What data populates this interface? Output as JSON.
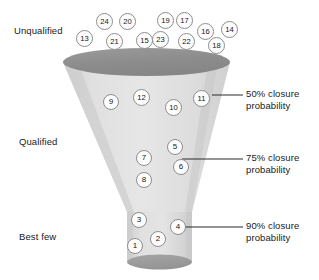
{
  "diagram": {
    "colors": {
      "funnel_body_light": "#e2e2e2",
      "funnel_body_mid": "#d2d2d2",
      "funnel_top_ellipse": "#8f8f8f",
      "funnel_bottom_ellipse": "#9a9a9a",
      "node_fill": "#fdfdfd",
      "node_stroke": "#8d8d8d",
      "text": "#1a1a1a",
      "leader_line": "#2b2b2b"
    }
  },
  "stage_labels": [
    {
      "text": "Unqualified",
      "x": 14,
      "y": 25
    },
    {
      "text": "Qualified",
      "x": 19,
      "y": 136
    },
    {
      "text": "Best few",
      "x": 19,
      "y": 231
    }
  ],
  "probability_labels": [
    {
      "line1": "50% closure",
      "line2": "probability",
      "x": 246,
      "y": 88,
      "leader": {
        "x1": 212,
        "y1": 95,
        "x2": 243,
        "y2": 95
      }
    },
    {
      "line1": "75% closure",
      "line2": "probability",
      "x": 246,
      "y": 152,
      "leader": {
        "x1": 182,
        "y1": 159,
        "x2": 243,
        "y2": 159
      }
    },
    {
      "line1": "90% closure",
      "line2": "probability",
      "x": 246,
      "y": 220,
      "leader": {
        "x1": 186,
        "y1": 227,
        "x2": 243,
        "y2": 227
      }
    }
  ],
  "leads": {
    "unqualified": [
      {
        "label": "13",
        "x": 76,
        "y": 30
      },
      {
        "label": "24",
        "x": 96,
        "y": 13
      },
      {
        "label": "21",
        "x": 106,
        "y": 33
      },
      {
        "label": "20",
        "x": 119,
        "y": 13
      },
      {
        "label": "15",
        "x": 136,
        "y": 32
      },
      {
        "label": "23",
        "x": 152,
        "y": 31
      },
      {
        "label": "19",
        "x": 157,
        "y": 12
      },
      {
        "label": "17",
        "x": 176,
        "y": 12
      },
      {
        "label": "22",
        "x": 178,
        "y": 33
      },
      {
        "label": "16",
        "x": 197,
        "y": 23
      },
      {
        "label": "18",
        "x": 208,
        "y": 37
      },
      {
        "label": "14",
        "x": 221,
        "y": 21
      }
    ],
    "upper_funnel": [
      {
        "label": "9",
        "x": 103,
        "y": 94
      },
      {
        "label": "12",
        "x": 133,
        "y": 89
      },
      {
        "label": "10",
        "x": 165,
        "y": 99
      },
      {
        "label": "11",
        "x": 193,
        "y": 90
      }
    ],
    "mid_funnel": [
      {
        "label": "5",
        "x": 167,
        "y": 139
      },
      {
        "label": "7",
        "x": 136,
        "y": 150
      },
      {
        "label": "6",
        "x": 173,
        "y": 159
      },
      {
        "label": "8",
        "x": 136,
        "y": 172
      }
    ],
    "best_few": [
      {
        "label": "3",
        "x": 131,
        "y": 212
      },
      {
        "label": "4",
        "x": 170,
        "y": 219
      },
      {
        "label": "2",
        "x": 150,
        "y": 231
      },
      {
        "label": "1",
        "x": 127,
        "y": 238
      }
    ]
  }
}
